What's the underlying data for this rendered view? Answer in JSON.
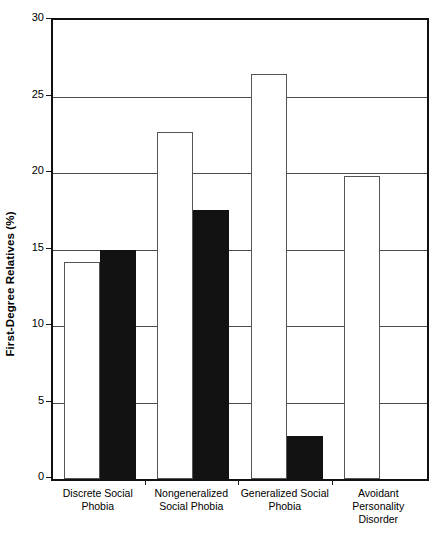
{
  "chart_data": {
    "type": "bar",
    "title": "",
    "subtitle": "",
    "xlabel": "",
    "ylabel": "First-Degree Relatives (%)",
    "categories": [
      "Discrete Social Phobia",
      "Nongeneralized Social Phobia",
      "Generalized Social Phobia",
      "Avoidant Personality Disorder"
    ],
    "category_lines": [
      [
        "Discrete Social",
        "Phobia"
      ],
      [
        "Nongeneralized",
        "Social Phobia"
      ],
      [
        "Generalized Social",
        "Phobia"
      ],
      [
        "Avoidant",
        "Personality",
        "Disorder"
      ]
    ],
    "series": [
      {
        "name": "open-bar",
        "fill": "white",
        "color": "#ffffff",
        "edge_color": "#555555",
        "values": [
          14.2,
          22.7,
          26.5,
          19.8
        ]
      },
      {
        "name": "filled-bar",
        "fill": "black",
        "color": "#121212",
        "edge_color": "#121212",
        "values": [
          15.0,
          17.6,
          2.8,
          null
        ]
      }
    ],
    "ylim": [
      0,
      30
    ],
    "ytick_values": [
      0,
      5,
      10,
      15,
      20,
      25,
      30
    ],
    "ytick_labels": [
      "0",
      "5",
      "10",
      "15",
      "20",
      "25",
      "30"
    ],
    "grid": true,
    "grid_axis": "y",
    "legend": false,
    "legend_position": "none",
    "background_color": "#ffffff",
    "frame_color": "#111111"
  }
}
